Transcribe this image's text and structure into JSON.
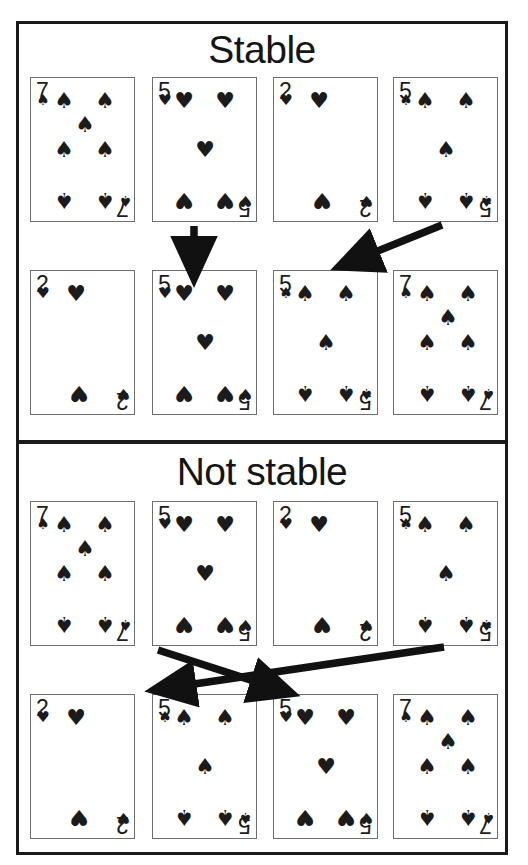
{
  "figure": {
    "caption_none": "",
    "bg_color": "#ffffff",
    "ink_color": "#1b1b1b",
    "card_border_color": "#6e6e6e"
  },
  "panels": [
    {
      "id": "stable",
      "title": "Stable",
      "top_row": [
        {
          "rank": "7",
          "suit": "spade",
          "suit_glyph": "♠",
          "label": "7 of spades"
        },
        {
          "rank": "5",
          "suit": "heart",
          "suit_glyph": "♥",
          "label": "5 of hearts"
        },
        {
          "rank": "2",
          "suit": "heart",
          "suit_glyph": "♥",
          "label": "2 of hearts"
        },
        {
          "rank": "5",
          "suit": "spade",
          "suit_glyph": "♠",
          "label": "5 of spades"
        }
      ],
      "bottom_row": [
        {
          "rank": "2",
          "suit": "heart",
          "suit_glyph": "♥",
          "label": "2 of hearts"
        },
        {
          "rank": "5",
          "suit": "heart",
          "suit_glyph": "♥",
          "label": "5 of hearts"
        },
        {
          "rank": "5",
          "suit": "spade",
          "suit_glyph": "♠",
          "label": "5 of spades"
        },
        {
          "rank": "7",
          "suit": "spade",
          "suit_glyph": "♠",
          "label": "7 of spades"
        }
      ],
      "arrows": [
        {
          "from_index": 1,
          "to_index": 1,
          "kind": "vertical",
          "label": "5 of hearts stays before 5 of spades"
        },
        {
          "from_index": 3,
          "to_index": 2,
          "kind": "diagonal-left",
          "label": "5 of spades moves to third position"
        }
      ]
    },
    {
      "id": "not-stable",
      "title": "Not stable",
      "top_row": [
        {
          "rank": "7",
          "suit": "spade",
          "suit_glyph": "♠",
          "label": "7 of spades"
        },
        {
          "rank": "5",
          "suit": "heart",
          "suit_glyph": "♥",
          "label": "5 of hearts"
        },
        {
          "rank": "2",
          "suit": "heart",
          "suit_glyph": "♥",
          "label": "2 of hearts"
        },
        {
          "rank": "5",
          "suit": "spade",
          "suit_glyph": "♠",
          "label": "5 of spades"
        }
      ],
      "bottom_row": [
        {
          "rank": "2",
          "suit": "heart",
          "suit_glyph": "♥",
          "label": "2 of hearts"
        },
        {
          "rank": "5",
          "suit": "spade",
          "suit_glyph": "♠",
          "label": "5 of spades"
        },
        {
          "rank": "5",
          "suit": "heart",
          "suit_glyph": "♥",
          "label": "5 of hearts"
        },
        {
          "rank": "7",
          "suit": "spade",
          "suit_glyph": "♠",
          "label": "7 of spades"
        }
      ],
      "arrows": [
        {
          "from_index": 1,
          "to_index": 2,
          "kind": "cross-right",
          "label": "5 of hearts moves to third position"
        },
        {
          "from_index": 3,
          "to_index": 1,
          "kind": "cross-left",
          "label": "5 of spades moves to second position"
        }
      ]
    }
  ],
  "pip_layouts": {
    "2": [
      {
        "x": 12,
        "y": 22,
        "size": "small",
        "flip": false
      },
      {
        "x": 45,
        "y": 23,
        "size": "big",
        "flip": false
      },
      {
        "x": 48,
        "y": 122,
        "size": "big",
        "flip": true
      },
      {
        "x": 92,
        "y": 122,
        "size": "small",
        "flip": true
      }
    ],
    "5": [
      {
        "x": 12,
        "y": 22,
        "size": "small",
        "flip": false
      },
      {
        "x": 31,
        "y": 23,
        "size": "big",
        "flip": false
      },
      {
        "x": 72,
        "y": 23,
        "size": "big",
        "flip": false
      },
      {
        "x": 52,
        "y": 72,
        "size": "big",
        "flip": false
      },
      {
        "x": 31,
        "y": 122,
        "size": "big",
        "flip": true
      },
      {
        "x": 72,
        "y": 122,
        "size": "big",
        "flip": true
      },
      {
        "x": 92,
        "y": 122,
        "size": "small",
        "flip": true
      }
    ],
    "7": [
      {
        "x": 12,
        "y": 22,
        "size": "small",
        "flip": false
      },
      {
        "x": 33,
        "y": 23,
        "size": "big",
        "flip": false
      },
      {
        "x": 74,
        "y": 23,
        "size": "big",
        "flip": false
      },
      {
        "x": 54,
        "y": 47,
        "size": "big",
        "flip": false
      },
      {
        "x": 33,
        "y": 72,
        "size": "big",
        "flip": false
      },
      {
        "x": 74,
        "y": 72,
        "size": "big",
        "flip": false
      },
      {
        "x": 33,
        "y": 122,
        "size": "big",
        "flip": true
      },
      {
        "x": 74,
        "y": 122,
        "size": "big",
        "flip": true
      },
      {
        "x": 94,
        "y": 122,
        "size": "small",
        "flip": true
      }
    ]
  }
}
